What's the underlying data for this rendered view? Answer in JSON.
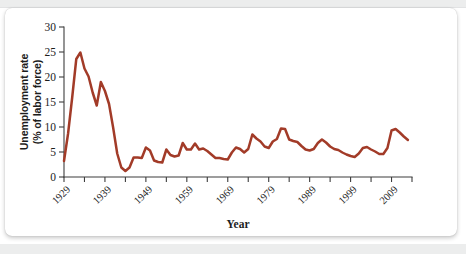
{
  "figure": {
    "background_color": "#ffffff",
    "card_color": "#ffffff",
    "band_color": "#eceded"
  },
  "chart_data": {
    "type": "line",
    "title": "",
    "subtitle": "",
    "xlabel": "Year",
    "ylabel_line1": "Unemployment rate",
    "ylabel_line2": "(% of labor force)",
    "ylabel": "Unemployment rate (% of labor force)",
    "line_color": "#a23b28",
    "axis_color": "#3d3d3d",
    "grid": false,
    "legend": "none",
    "xlim": [
      1929,
      2014
    ],
    "ylim": [
      0,
      30
    ],
    "ytick_labels": [
      "0",
      "5",
      "10",
      "15",
      "20",
      "25",
      "30"
    ],
    "ytick_values": [
      0,
      5,
      10,
      15,
      20,
      25,
      30
    ],
    "xtick_labels": [
      "1929",
      "1939",
      "1949",
      "1959",
      "1969",
      "1979",
      "1989",
      "1999",
      "2009"
    ],
    "xtick_values": [
      1929,
      1939,
      1949,
      1959,
      1969,
      1979,
      1989,
      1999,
      2009
    ],
    "xminor_step": 5,
    "series": [
      {
        "name": "Unemployment rate",
        "color": "#a23b28",
        "x": [
          1929,
          1930,
          1931,
          1932,
          1933,
          1934,
          1935,
          1936,
          1937,
          1938,
          1939,
          1940,
          1941,
          1942,
          1943,
          1944,
          1945,
          1946,
          1947,
          1948,
          1949,
          1950,
          1951,
          1952,
          1953,
          1954,
          1955,
          1956,
          1957,
          1958,
          1959,
          1960,
          1961,
          1962,
          1963,
          1964,
          1965,
          1966,
          1967,
          1968,
          1969,
          1970,
          1971,
          1972,
          1973,
          1974,
          1975,
          1976,
          1977,
          1978,
          1979,
          1980,
          1981,
          1982,
          1983,
          1984,
          1985,
          1986,
          1987,
          1988,
          1989,
          1990,
          1991,
          1992,
          1993,
          1994,
          1995,
          1996,
          1997,
          1998,
          1999,
          2000,
          2001,
          2002,
          2003,
          2004,
          2005,
          2006,
          2007,
          2008,
          2009,
          2010,
          2011,
          2012,
          2013
        ],
        "values": [
          3.2,
          8.7,
          15.9,
          23.6,
          24.9,
          21.7,
          20.1,
          16.9,
          14.3,
          19.0,
          17.2,
          14.6,
          9.9,
          4.7,
          1.9,
          1.2,
          1.9,
          3.9,
          3.9,
          3.8,
          5.9,
          5.3,
          3.3,
          3.0,
          2.9,
          5.5,
          4.4,
          4.1,
          4.3,
          6.8,
          5.5,
          5.5,
          6.7,
          5.5,
          5.7,
          5.2,
          4.5,
          3.8,
          3.8,
          3.6,
          3.5,
          4.9,
          5.9,
          5.6,
          4.9,
          5.6,
          8.5,
          7.7,
          7.1,
          6.1,
          5.8,
          7.1,
          7.6,
          9.7,
          9.6,
          7.5,
          7.2,
          7.0,
          6.2,
          5.5,
          5.3,
          5.6,
          6.8,
          7.5,
          6.9,
          6.1,
          5.6,
          5.4,
          4.9,
          4.5,
          4.2,
          4.0,
          4.7,
          5.8,
          6.0,
          5.5,
          5.1,
          4.6,
          4.6,
          5.8,
          9.3,
          9.6,
          8.9,
          8.1,
          7.4
        ]
      }
    ]
  }
}
